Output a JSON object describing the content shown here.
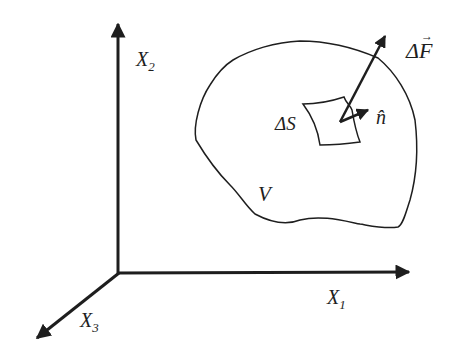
{
  "diagram": {
    "axes": [
      {
        "id": "x1",
        "label": "X",
        "subscript": "1"
      },
      {
        "id": "x2",
        "label": "X",
        "subscript": "2"
      },
      {
        "id": "x3",
        "label": "X",
        "subscript": "3"
      }
    ],
    "body_label": "V",
    "surface_label": "ΔS",
    "normal_label": "n̂",
    "force_label": "ΔF",
    "force_vector_mark": "→",
    "colors": {
      "stroke": "#1e1e1e",
      "background": "#ffffff"
    }
  }
}
